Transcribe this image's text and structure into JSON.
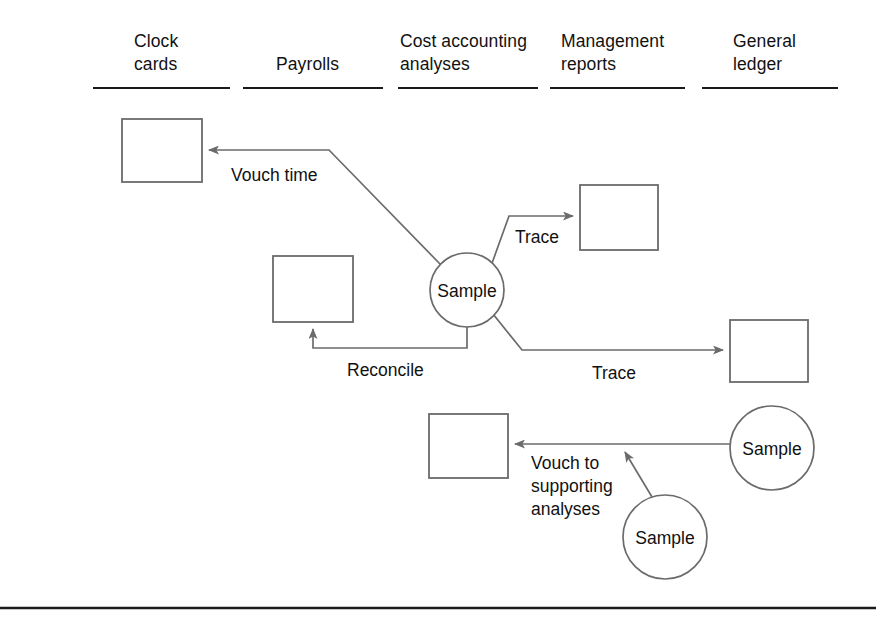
{
  "diagram": {
    "line_color": "#6b6b6b",
    "rule_color": "#1a1a1a",
    "text_color": "#111111",
    "background": "#ffffff",
    "columns": [
      {
        "id": "clock-cards",
        "label": "Clock\ncards",
        "text_x": 134,
        "text_y": 30,
        "rule_x1": 93,
        "rule_x2": 230,
        "rule_y": 88
      },
      {
        "id": "payrolls",
        "label": "Payrolls",
        "text_x": 276,
        "text_y": 53,
        "rule_x1": 243,
        "rule_x2": 383,
        "rule_y": 88
      },
      {
        "id": "cost-accounting-analyses",
        "label": "Cost accounting\nanalyses",
        "text_x": 400,
        "text_y": 30,
        "rule_x1": 398,
        "rule_x2": 538,
        "rule_y": 88
      },
      {
        "id": "management-reports",
        "label": "Management\nreports",
        "text_x": 561,
        "text_y": 30,
        "rule_x1": 550,
        "rule_x2": 685,
        "rule_y": 88
      },
      {
        "id": "general-ledger",
        "label": "General\nledger",
        "text_x": 733,
        "text_y": 30,
        "rule_x1": 702,
        "rule_x2": 838,
        "rule_y": 88
      }
    ],
    "boxes": [
      {
        "id": "box-clock-card",
        "x": 122,
        "y": 119,
        "w": 80,
        "h": 63
      },
      {
        "id": "box-payroll",
        "x": 273,
        "y": 256,
        "w": 80,
        "h": 66
      },
      {
        "id": "box-management-report",
        "x": 580,
        "y": 185,
        "w": 78,
        "h": 65
      },
      {
        "id": "box-general-ledger",
        "x": 730,
        "y": 320,
        "w": 78,
        "h": 62
      },
      {
        "id": "box-cost-analysis",
        "x": 429,
        "y": 414,
        "w": 79,
        "h": 64
      }
    ],
    "circles": [
      {
        "id": "sample-main",
        "label": "Sample",
        "cx": 467,
        "cy": 290,
        "r": 37
      },
      {
        "id": "sample-general-ledger",
        "label": "Sample",
        "cx": 772,
        "cy": 448,
        "r": 42
      },
      {
        "id": "sample-management-report",
        "label": "Sample",
        "cx": 665,
        "cy": 537,
        "r": 42
      }
    ],
    "edges": [
      {
        "id": "edge-vouch-time",
        "label": "Vouch time",
        "label_x": 231,
        "label_y": 164,
        "from": "sample-main",
        "to": "box-clock-card",
        "path": "M 441 265 L 329 150 L 209 150"
      },
      {
        "id": "edge-trace-management-reports",
        "label": "Trace",
        "label_x": 515,
        "label_y": 226,
        "from": "sample-main",
        "to": "box-management-report",
        "path": "M 491 266 L 509 216 L 573 216"
      },
      {
        "id": "edge-trace-general-ledger",
        "label": "Trace",
        "label_x": 592,
        "label_y": 362,
        "from": "sample-main",
        "to": "box-general-ledger",
        "path": "M 493 314 L 522 350 L 723 350"
      },
      {
        "id": "edge-reconcile",
        "label": "Reconcile",
        "label_x": 347,
        "label_y": 359,
        "from": "sample-main",
        "to": "box-payroll",
        "path": "M 467 327 L 467 348 L 313 348 L 313 329"
      },
      {
        "id": "edge-vouch-to-supporting-analyses",
        "label": "Vouch to\nsupporting\nanalyses",
        "label_x": 531,
        "label_y": 452,
        "from": "sample-general-ledger",
        "to": "box-cost-analysis",
        "path": "M 730 444 L 515 444"
      },
      {
        "id": "edge-sample-to-vouch-line",
        "label": "",
        "from": "sample-management-report",
        "to": "edge-vouch-to-supporting-analyses",
        "path": "M 652 497 L 625 452"
      }
    ],
    "bottom_rule": {
      "x1": 0,
      "x2": 876,
      "y": 608
    }
  }
}
